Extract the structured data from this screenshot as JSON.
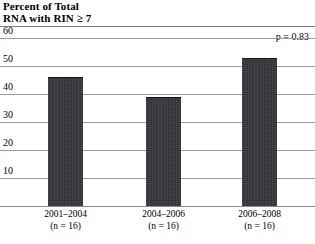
{
  "chart_data": {
    "type": "bar",
    "title": "Percent of Total\nRNA with RIN ≥ 7",
    "xlabel": "",
    "ylabel": "Percent of Total RNA with RIN ≥ 7",
    "categories": [
      "2001–2004",
      "2004–2006",
      "2006–2008"
    ],
    "group_counts": [
      "(n = 16)",
      "(n = 16)",
      "(n = 16)"
    ],
    "values": [
      46,
      39,
      53
    ],
    "ylim": [
      0,
      60
    ],
    "yticks": [
      60,
      50,
      40,
      30,
      20,
      10
    ],
    "ytick_labels": [
      "60",
      "50",
      "40",
      "30",
      "20",
      "10"
    ],
    "grid": true,
    "legend": "none",
    "annotations": [
      {
        "name": "p-value",
        "text": "p = 0.83"
      }
    ],
    "bar_color": "#333438",
    "gridline_color": "#9c9c9c",
    "background_color": "#ffffff"
  },
  "figure": {
    "title_line1": "Percent of Total",
    "title_line2": "RNA with RIN ≥ 7",
    "pvalue_text": "p = 0.83"
  }
}
